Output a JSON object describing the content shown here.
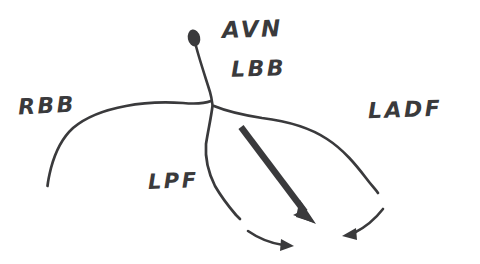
{
  "diagram": {
    "style": "hand-drawn ink sketch",
    "ink_color": "#3a3a3c",
    "background_color": "#ffffff",
    "labels": [
      {
        "id": "avn",
        "text": "AVN",
        "x": 222,
        "y": 18,
        "meaning": "atrioventricular node"
      },
      {
        "id": "lbb",
        "text": "LBB",
        "x": 231,
        "y": 58,
        "meaning": "left bundle branch"
      },
      {
        "id": "rbb",
        "text": "RBB",
        "x": 18,
        "y": 95,
        "meaning": "right bundle branch"
      },
      {
        "id": "ladf",
        "text": "LADF",
        "x": 368,
        "y": 99,
        "meaning": "left anterior division fascicle"
      },
      {
        "id": "lpf",
        "text": "LPF",
        "x": 148,
        "y": 171,
        "meaning": "left posterior fascicle"
      }
    ],
    "nodes": [
      {
        "id": "avn-node",
        "shape": "filled-teardrop",
        "x": 194,
        "y": 38
      }
    ],
    "branches": [
      {
        "id": "av-stem",
        "from": "avn-node",
        "to": "junction"
      },
      {
        "id": "rbb-path",
        "from": "junction",
        "to": "left-terminal"
      },
      {
        "id": "ladf-path",
        "from": "junction",
        "to": "right-terminal"
      },
      {
        "id": "lpf-path",
        "from": "junction",
        "to": "bottom-terminal"
      }
    ],
    "arrows": [
      {
        "id": "main-vector",
        "style": "thick-straight",
        "from_x": 241,
        "from_y": 127,
        "to_x": 312,
        "to_y": 222
      },
      {
        "id": "lpf-vector",
        "style": "thin-curved",
        "from_x": 248,
        "from_y": 231,
        "to_x": 292,
        "to_y": 246
      },
      {
        "id": "ladf-vector",
        "style": "thin-curved",
        "from_x": 383,
        "from_y": 209,
        "to_x": 345,
        "to_y": 236
      }
    ]
  }
}
